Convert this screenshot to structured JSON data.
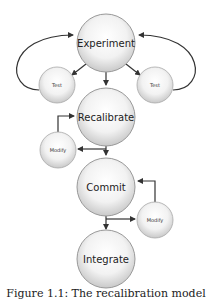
{
  "diagram": {
    "nodes": {
      "experiment": "Experiment",
      "test_left": "Test",
      "test_right": "Test",
      "recalibrate": "Recalibrate",
      "modify_left": "Modify",
      "commit": "Commit",
      "modify_right": "Modify",
      "integrate": "Integrate"
    },
    "caption": "Figure 1.1: The recalibration model"
  }
}
